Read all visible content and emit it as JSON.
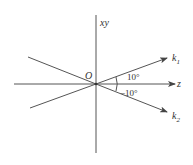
{
  "diagram": {
    "axes": {
      "vertical_label": "xy",
      "horizontal_label": "z",
      "origin_label": "O"
    },
    "vectors": [
      {
        "name": "k",
        "subscript": "1",
        "angle_label": "10°",
        "angle_deg": 10
      },
      {
        "name": "k",
        "subscript": "2",
        "angle_label": "−10°",
        "angle_deg": -10
      }
    ],
    "colors": {
      "line": "#555555",
      "text": "#333333",
      "background": "#ffffff"
    }
  }
}
